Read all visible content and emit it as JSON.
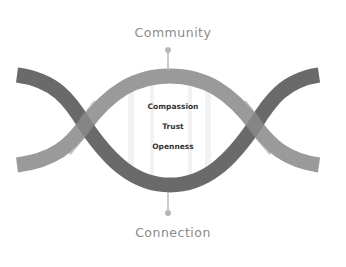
{
  "diagram": {
    "top_label": "Community",
    "bottom_label": "Connection",
    "center_values": [
      "Compassion",
      "Trust",
      "Openness"
    ],
    "colors": {
      "dark_wave": "#6a6a6a",
      "light_wave": "#9a9a9a",
      "connector": "#b8b8b8",
      "label_text": "#8a8a8a",
      "center_text": "#333333",
      "background": "#ffffff"
    },
    "icons": [
      "top-connector-dot-icon",
      "bottom-connector-dot-icon"
    ]
  }
}
